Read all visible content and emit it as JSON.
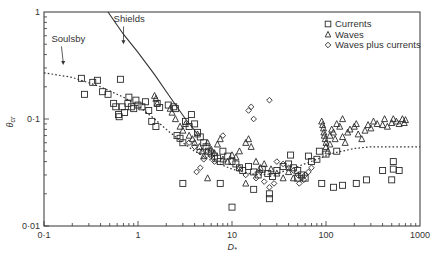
{
  "chart_data": {
    "type": "scatter",
    "title": "",
    "xlabel": "D*",
    "ylabel": "θcr",
    "xscale": "log",
    "yscale": "log",
    "xlim": [
      0.1,
      1000
    ],
    "ylim": [
      0.01,
      1
    ],
    "x_ticks": [
      {
        "value": 0.1,
        "label": "0·1"
      },
      {
        "value": 1,
        "label": "1"
      },
      {
        "value": 10,
        "label": "10"
      },
      {
        "value": 100,
        "label": "100"
      },
      {
        "value": 1000,
        "label": "1000"
      }
    ],
    "y_ticks": [
      {
        "value": 0.01,
        "label": "0·01"
      },
      {
        "value": 0.1,
        "label": "0·1"
      },
      {
        "value": 1,
        "label": "1"
      }
    ],
    "grid": false,
    "legend": {
      "position": "upper right",
      "entries": [
        {
          "label": "Currents",
          "marker": "square"
        },
        {
          "label": "Waves",
          "marker": "triangle"
        },
        {
          "label": "Waves plus currents",
          "marker": "diamond"
        }
      ]
    },
    "annotations": [
      {
        "text": "Shields",
        "x": 0.55,
        "y": 0.8,
        "arrow_to": [
          0.7,
          0.5
        ]
      },
      {
        "text": "Soulsby",
        "x": 0.12,
        "y": 0.52,
        "arrow_to": [
          0.16,
          0.32
        ]
      }
    ],
    "curves": [
      {
        "name": "Shields",
        "style": "solid",
        "points": [
          [
            0.48,
            1.0
          ],
          [
            0.7,
            0.62
          ],
          [
            1.0,
            0.42
          ],
          [
            1.5,
            0.26
          ],
          [
            2.2,
            0.16
          ],
          [
            3.2,
            0.1
          ],
          [
            4.2,
            0.074
          ]
        ]
      },
      {
        "name": "Soulsby",
        "style": "dotted",
        "points": [
          [
            0.1,
            0.27
          ],
          [
            0.2,
            0.245
          ],
          [
            0.4,
            0.2
          ],
          [
            0.7,
            0.16
          ],
          [
            1.0,
            0.133
          ],
          [
            1.5,
            0.1
          ],
          [
            2.0,
            0.08
          ],
          [
            3.0,
            0.06
          ],
          [
            4.0,
            0.05
          ],
          [
            6.0,
            0.041
          ],
          [
            10.0,
            0.034
          ],
          [
            15.0,
            0.031
          ],
          [
            20.0,
            0.03
          ],
          [
            30.0,
            0.031
          ],
          [
            50.0,
            0.036
          ],
          [
            80.0,
            0.042
          ],
          [
            120.0,
            0.048
          ],
          [
            200.0,
            0.053
          ],
          [
            300.0,
            0.055
          ],
          [
            500.0,
            0.055
          ],
          [
            1000.0,
            0.055
          ]
        ]
      }
    ],
    "series": [
      {
        "name": "Currents",
        "marker": "square",
        "points": [
          [
            0.25,
            0.24
          ],
          [
            0.27,
            0.17
          ],
          [
            0.33,
            0.22
          ],
          [
            0.37,
            0.23
          ],
          [
            0.42,
            0.18
          ],
          [
            0.48,
            0.17
          ],
          [
            0.55,
            0.14
          ],
          [
            0.58,
            0.13
          ],
          [
            0.62,
            0.11
          ],
          [
            0.63,
            0.105
          ],
          [
            0.68,
            0.13
          ],
          [
            0.72,
            0.115
          ],
          [
            0.78,
            0.14
          ],
          [
            0.85,
            0.13
          ],
          [
            0.9,
            0.125
          ],
          [
            0.95,
            0.15
          ],
          [
            0.65,
            0.235
          ],
          [
            0.8,
            0.16
          ],
          [
            1.1,
            0.13
          ],
          [
            1.2,
            0.145
          ],
          [
            1.3,
            0.12
          ],
          [
            1.4,
            0.095
          ],
          [
            1.55,
            0.085
          ],
          [
            1.0,
            0.135
          ],
          [
            1.6,
            0.14
          ],
          [
            1.7,
            0.128
          ],
          [
            2.1,
            0.135
          ],
          [
            2.4,
            0.13
          ],
          [
            2.5,
            0.125
          ],
          [
            2.6,
            0.07
          ],
          [
            2.8,
            0.066
          ],
          [
            3.0,
            0.06
          ],
          [
            3.2,
            0.095
          ],
          [
            3.5,
            0.085
          ],
          [
            3.7,
            0.11
          ],
          [
            4.0,
            0.09
          ],
          [
            4.3,
            0.075
          ],
          [
            4.6,
            0.068
          ],
          [
            5.0,
            0.06
          ],
          [
            5.3,
            0.055
          ],
          [
            5.6,
            0.05
          ],
          [
            6.0,
            0.048
          ],
          [
            6.5,
            0.045
          ],
          [
            7.0,
            0.043
          ],
          [
            7.5,
            0.04
          ],
          [
            8.0,
            0.05
          ],
          [
            9.0,
            0.045
          ],
          [
            10.0,
            0.04
          ],
          [
            11.0,
            0.038
          ],
          [
            12.0,
            0.035
          ],
          [
            13.0,
            0.033
          ],
          [
            15.0,
            0.036
          ],
          [
            17.0,
            0.032
          ],
          [
            19.0,
            0.03
          ],
          [
            21.0,
            0.034
          ],
          [
            24.0,
            0.031
          ],
          [
            27.0,
            0.029
          ],
          [
            30.0,
            0.033
          ],
          [
            35.0,
            0.036
          ],
          [
            40.0,
            0.038
          ],
          [
            45.0,
            0.035
          ],
          [
            50.0,
            0.033
          ],
          [
            55.0,
            0.03
          ],
          [
            60.0,
            0.028
          ],
          [
            70.0,
            0.04
          ],
          [
            80.0,
            0.042
          ],
          [
            3.0,
            0.025
          ],
          [
            7.5,
            0.025
          ],
          [
            10.0,
            0.015
          ],
          [
            17.0,
            0.022
          ],
          [
            25.0,
            0.02
          ],
          [
            25.0,
            0.018
          ],
          [
            50.0,
            0.028
          ],
          [
            90.0,
            0.025
          ],
          [
            120.0,
            0.023
          ],
          [
            150.0,
            0.024
          ],
          [
            210.0,
            0.025
          ],
          [
            270.0,
            0.027
          ],
          [
            500.0,
            0.027
          ],
          [
            520.0,
            0.034
          ],
          [
            520.0,
            0.04
          ],
          [
            600.0,
            0.033
          ],
          [
            400.0,
            0.033
          ],
          [
            130.0,
            0.05
          ],
          [
            100.0,
            0.047
          ],
          [
            85.0,
            0.05
          ],
          [
            65.0,
            0.045
          ],
          [
            42.0,
            0.046
          ]
        ]
      },
      {
        "name": "Waves",
        "marker": "triangle",
        "points": [
          [
            1.5,
            0.165
          ],
          [
            1.55,
            0.155
          ],
          [
            1.6,
            0.14
          ],
          [
            2.2,
            0.125
          ],
          [
            2.3,
            0.115
          ],
          [
            2.5,
            0.1
          ],
          [
            2.8,
            0.085
          ],
          [
            3.0,
            0.078
          ],
          [
            3.2,
            0.09
          ],
          [
            3.5,
            0.07
          ],
          [
            3.8,
            0.065
          ],
          [
            4.0,
            0.06
          ],
          [
            4.3,
            0.072
          ],
          [
            4.5,
            0.055
          ],
          [
            4.8,
            0.05
          ],
          [
            5.0,
            0.045
          ],
          [
            5.5,
            0.06
          ],
          [
            6.0,
            0.052
          ],
          [
            6.5,
            0.048
          ],
          [
            7.0,
            0.058
          ],
          [
            7.5,
            0.065
          ],
          [
            8.0,
            0.042
          ],
          [
            9.0,
            0.04
          ],
          [
            10.0,
            0.046
          ],
          [
            11.0,
            0.044
          ],
          [
            12.0,
            0.05
          ],
          [
            14.0,
            0.06
          ],
          [
            15.0,
            0.065
          ],
          [
            16.0,
            0.055
          ],
          [
            18.0,
            0.04
          ],
          [
            20.0,
            0.035
          ],
          [
            22.0,
            0.038
          ],
          [
            26.0,
            0.034
          ],
          [
            30.0,
            0.031
          ],
          [
            35.0,
            0.028
          ],
          [
            5.5,
            0.028
          ],
          [
            14.0,
            0.025
          ],
          [
            40.0,
            0.032
          ],
          [
            45.0,
            0.028
          ],
          [
            90.0,
            0.095
          ],
          [
            92.0,
            0.088
          ],
          [
            94.0,
            0.082
          ],
          [
            95.0,
            0.075
          ],
          [
            96.0,
            0.07
          ],
          [
            98.0,
            0.065
          ],
          [
            100.0,
            0.06
          ],
          [
            100.0,
            0.055
          ],
          [
            105.0,
            0.05
          ],
          [
            110.0,
            0.07
          ],
          [
            115.0,
            0.08
          ],
          [
            120.0,
            0.075
          ],
          [
            130.0,
            0.09
          ],
          [
            140.0,
            0.085
          ],
          [
            150.0,
            0.068
          ],
          [
            160.0,
            0.06
          ],
          [
            170.0,
            0.075
          ],
          [
            180.0,
            0.08
          ],
          [
            200.0,
            0.085
          ],
          [
            210.0,
            0.09
          ],
          [
            220.0,
            0.072
          ],
          [
            240.0,
            0.065
          ],
          [
            260.0,
            0.078
          ],
          [
            280.0,
            0.088
          ],
          [
            300.0,
            0.082
          ],
          [
            320.0,
            0.095
          ],
          [
            350.0,
            0.09
          ],
          [
            400.0,
            0.088
          ],
          [
            420.0,
            0.1
          ],
          [
            450.0,
            0.085
          ],
          [
            500.0,
            0.092
          ],
          [
            520.0,
            0.1
          ],
          [
            560.0,
            0.095
          ],
          [
            600.0,
            0.09
          ],
          [
            650.0,
            0.1
          ],
          [
            680.0,
            0.092
          ],
          [
            700.0,
            0.098
          ],
          [
            150.0,
            0.1
          ],
          [
            110.0,
            0.058
          ],
          [
            125.0,
            0.065
          ]
        ]
      },
      {
        "name": "Waves plus currents",
        "marker": "diamond",
        "points": [
          [
            3.5,
            0.06
          ],
          [
            4.0,
            0.055
          ],
          [
            4.5,
            0.05
          ],
          [
            5.0,
            0.042
          ],
          [
            5.5,
            0.05
          ],
          [
            6.0,
            0.045
          ],
          [
            6.5,
            0.04
          ],
          [
            4.2,
            0.032
          ],
          [
            4.6,
            0.035
          ],
          [
            8.0,
            0.07
          ],
          [
            15.0,
            0.12
          ],
          [
            16.0,
            0.13
          ],
          [
            17.0,
            0.1
          ],
          [
            25.0,
            0.15
          ],
          [
            30.0,
            0.04
          ],
          [
            35.0,
            0.038
          ],
          [
            40.0,
            0.035
          ],
          [
            45.0,
            0.033
          ],
          [
            50.0,
            0.03
          ],
          [
            55.0,
            0.028
          ],
          [
            60.0,
            0.03
          ],
          [
            65.0,
            0.032
          ],
          [
            70.0,
            0.035
          ],
          [
            12.0,
            0.035
          ],
          [
            14.0,
            0.03
          ],
          [
            18.0,
            0.028
          ],
          [
            20.0,
            0.032
          ],
          [
            22.0,
            0.026
          ],
          [
            25.0,
            0.023
          ],
          [
            28.0,
            0.025
          ],
          [
            52.0,
            0.025
          ],
          [
            58.0,
            0.027
          ]
        ]
      }
    ]
  }
}
